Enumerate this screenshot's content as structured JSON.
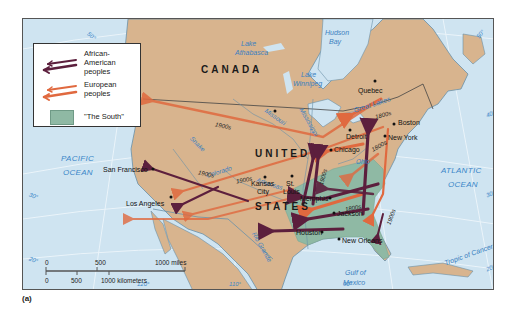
{
  "legend": {
    "items": [
      {
        "label": "African-American peoples",
        "lines": [
          "African-",
          "American",
          "peoples"
        ],
        "color": "#5c1f3d"
      },
      {
        "label": "European peoples",
        "lines": [
          "European",
          "peoples"
        ],
        "color": "#e0693f"
      },
      {
        "label": "\"The South\"",
        "color": "#8fb9a4"
      }
    ]
  },
  "countries": {
    "canada": "CANADA",
    "united": "UNITED",
    "states": "STATES"
  },
  "oceans": {
    "pacific": [
      "PACIFIC",
      "OCEAN"
    ],
    "atlantic": [
      "ATLANTIC",
      "OCEAN"
    ],
    "gulf": [
      "Gulf of",
      "Mexico"
    ]
  },
  "water_features": {
    "hudson_bay": [
      "Hudson",
      "Bay"
    ],
    "lake_athabasca": [
      "Lake",
      "Athabasca"
    ],
    "lake_winnipeg": [
      "Lake",
      "Winnipeg"
    ],
    "great_lakes": "Great Lakes",
    "tropic": "Tropic of Cancer"
  },
  "rivers": {
    "missouri": "Missouri",
    "mississippi": "Mississippi",
    "snake": "Snake",
    "colorado": "Colorado",
    "arkansas": "Arkansas",
    "ohio": "Ohio",
    "rio_grande": "Rio Grande"
  },
  "cities": {
    "quebec": "Quebec",
    "boston": "Boston",
    "new_york": "New York",
    "detroit": "Detroit",
    "chicago": "Chicago",
    "kansas_city": [
      "Kansas",
      "City"
    ],
    "st_louis": [
      "St.",
      "Louis"
    ],
    "memphis": "Memphis",
    "jackson": "Jackson",
    "new_orleans": "New Orleans",
    "houston": "Houston",
    "san_francisco": "San Francisco",
    "los_angeles": "Los Angeles"
  },
  "eras": {
    "nw_1900": "1900s",
    "sw_1900a": "1900s",
    "sw_1900b": "1900s",
    "ne_1800a": "1800s",
    "ne_1800b": "1800s",
    "south_1800": "1800s",
    "chi_1900": "1900s",
    "east_1900": "1900s"
  },
  "coords": {
    "lat50_tl": "50°",
    "lat50_r": "50°",
    "lat40_r": "40°",
    "lat30_r": "30°",
    "lat30_l": "30°",
    "lat20_l": "20°",
    "lat20_r": "20°",
    "lon120": "120°",
    "lon110": "110°",
    "lon90": "90°"
  },
  "scale": {
    "miles": [
      "0",
      "500",
      "1000  miles"
    ],
    "km": [
      "0",
      "500",
      "1000  kilometers"
    ]
  },
  "caption": "(a)",
  "colors": {
    "land": "#d8b48e",
    "water": "#cfe4f1",
    "south": "#8fb9a4",
    "african_american": "#5c1f3d",
    "european": "#e0693f"
  }
}
